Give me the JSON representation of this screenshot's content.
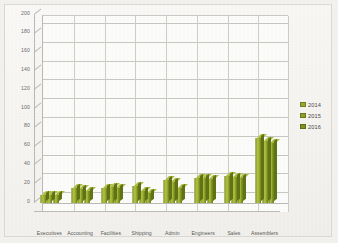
{
  "chart_data": {
    "type": "bar",
    "title": "",
    "subtitle": "",
    "xlabel": "",
    "ylabel": "",
    "ylim": [
      0,
      200
    ],
    "ytick_step": 20,
    "yticks": [
      "0",
      "20",
      "40",
      "60",
      "80",
      "100",
      "120",
      "140",
      "160",
      "180",
      "200"
    ],
    "grid": true,
    "style": "3d-clustered-column",
    "legend_position": "right",
    "categories": [
      "Executives",
      "Accounting",
      "Facilities",
      "Shipping",
      "Admin",
      "Engineers",
      "Sales",
      "Assemblers"
    ],
    "series": [
      {
        "name": "2014",
        "color": "#94a42a",
        "values": [
          8,
          16,
          16,
          18,
          24,
          27,
          29,
          69
        ]
      },
      {
        "name": "2015",
        "color": "#8aa025",
        "values": [
          9,
          15,
          17,
          13,
          22,
          27,
          28,
          66
        ]
      },
      {
        "name": "2016",
        "color": "#7d941f",
        "values": [
          9,
          13,
          16,
          11,
          16,
          26,
          27,
          64
        ]
      }
    ]
  },
  "legend": {
    "items": [
      {
        "label": "2014",
        "color": "#9aa830"
      },
      {
        "label": "2015",
        "color": "#8ea028"
      },
      {
        "label": "2016",
        "color": "#7f931f"
      }
    ]
  },
  "colors": {
    "page_background": "#f4f3f0",
    "plot_background": "#fdfdfc",
    "gridline": "#c9c9c4",
    "axis": "#bdbdb8",
    "tick_text": "#6c6c68",
    "category_text": "#585854",
    "bar_2014": "#94a42a",
    "bar_2015": "#8aa025",
    "bar_2016": "#7d941f"
  }
}
